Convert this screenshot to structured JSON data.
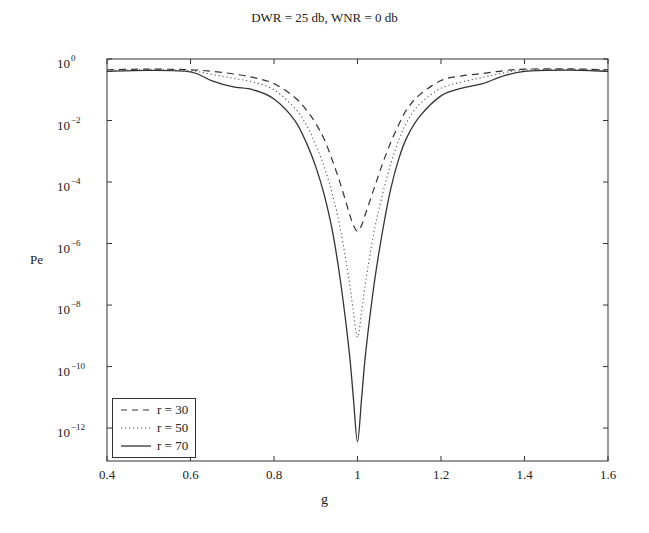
{
  "chart_data": {
    "type": "line",
    "title": "DWR = 25 db, WNR = 0 db",
    "xlabel": "g",
    "ylabel": "Pe",
    "xlim": [
      0.4,
      1.6
    ],
    "ylim_log10": [
      -13.07,
      0
    ],
    "yscale": "log",
    "grid": false,
    "legend_position": "lower left",
    "x_ticks": [
      "0.4",
      "0.6",
      "0.8",
      "1",
      "1.2",
      "1.4",
      "1.6"
    ],
    "x_tick_values": [
      0.4,
      0.6,
      0.8,
      1.0,
      1.2,
      1.4,
      1.6
    ],
    "y_ticks": [
      {
        "base": "10",
        "exp": "0",
        "log": 0
      },
      {
        "base": "10",
        "exp": "-2",
        "log": -2
      },
      {
        "base": "10",
        "exp": "-4",
        "log": -4
      },
      {
        "base": "10",
        "exp": "-6",
        "log": -6
      },
      {
        "base": "10",
        "exp": "-8",
        "log": -8
      },
      {
        "base": "10",
        "exp": "-10",
        "log": -10
      },
      {
        "base": "10",
        "exp": "-12",
        "log": -12
      }
    ],
    "x": [
      0.4,
      0.5,
      0.6,
      0.65,
      0.7,
      0.75,
      0.8,
      0.85,
      0.88,
      0.9,
      0.92,
      0.94,
      0.96,
      0.98,
      0.99,
      1.0,
      1.01,
      1.02,
      1.04,
      1.06,
      1.08,
      1.1,
      1.12,
      1.15,
      1.2,
      1.25,
      1.3,
      1.35,
      1.4,
      1.5,
      1.6
    ],
    "series": [
      {
        "name": "r = 30",
        "style": "dashed",
        "log10_values": [
          -0.35,
          -0.33,
          -0.35,
          -0.4,
          -0.48,
          -0.6,
          -0.8,
          -1.25,
          -1.7,
          -2.1,
          -2.6,
          -3.3,
          -4.1,
          -5.0,
          -5.4,
          -5.6,
          -5.4,
          -5.0,
          -4.2,
          -3.4,
          -2.7,
          -2.1,
          -1.6,
          -1.15,
          -0.7,
          -0.55,
          -0.47,
          -0.38,
          -0.33,
          -0.32,
          -0.35
        ]
      },
      {
        "name": "r = 50",
        "style": "dotted",
        "log10_values": [
          -0.37,
          -0.35,
          -0.38,
          -0.5,
          -0.62,
          -0.75,
          -1.0,
          -1.6,
          -2.2,
          -2.8,
          -3.5,
          -4.4,
          -5.6,
          -7.2,
          -8.2,
          -9.05,
          -8.2,
          -7.2,
          -5.6,
          -4.4,
          -3.4,
          -2.6,
          -2.0,
          -1.45,
          -0.95,
          -0.75,
          -0.6,
          -0.45,
          -0.36,
          -0.34,
          -0.37
        ]
      },
      {
        "name": "r = 70",
        "style": "solid",
        "log10_values": [
          -0.4,
          -0.37,
          -0.42,
          -0.7,
          -0.9,
          -1.0,
          -1.3,
          -2.0,
          -2.8,
          -3.5,
          -4.4,
          -5.6,
          -7.3,
          -9.5,
          -11.0,
          -12.45,
          -11.0,
          -9.5,
          -7.3,
          -5.6,
          -4.2,
          -3.2,
          -2.5,
          -1.85,
          -1.2,
          -0.95,
          -0.8,
          -0.55,
          -0.4,
          -0.36,
          -0.4
        ]
      }
    ]
  },
  "legend": [
    {
      "label": "r = 30"
    },
    {
      "label": "r = 50"
    },
    {
      "label": "r = 70"
    }
  ]
}
